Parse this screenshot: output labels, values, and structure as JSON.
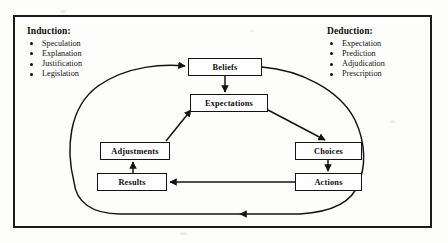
{
  "diagram": {
    "frame": {
      "border_color": "#1b1b1b"
    },
    "panels": [
      {
        "id": "induction",
        "title": "Induction:",
        "items": [
          "Speculation",
          "Explanation",
          "Justification",
          "Legislation"
        ]
      },
      {
        "id": "deduction",
        "title": "Deduction:",
        "items": [
          "Expectation",
          "Prediction",
          "Adjudication",
          "Prescription"
        ]
      }
    ],
    "nodes": [
      {
        "id": "beliefs",
        "label": "Beliefs"
      },
      {
        "id": "expectations",
        "label": "Expectations"
      },
      {
        "id": "adjustments",
        "label": "Adjustments"
      },
      {
        "id": "results",
        "label": "Results"
      },
      {
        "id": "choices",
        "label": "Choices"
      },
      {
        "id": "actions",
        "label": "Actions"
      }
    ],
    "edges": [
      {
        "from": "loop-left",
        "to": "beliefs",
        "style": "curved",
        "arrow": true
      },
      {
        "from": "beliefs",
        "to": "expectations",
        "style": "straight-down",
        "arrow": true
      },
      {
        "from": "beliefs",
        "to": "loop-right",
        "style": "curved",
        "arrow": false
      },
      {
        "from": "expectations",
        "to": "choices",
        "style": "diagonal",
        "arrow": true
      },
      {
        "from": "choices",
        "to": "actions",
        "style": "straight-down",
        "arrow": true
      },
      {
        "from": "actions",
        "to": "results",
        "style": "straight-left",
        "arrow": true
      },
      {
        "from": "results",
        "to": "adjustments",
        "style": "straight-up",
        "arrow": true
      },
      {
        "from": "adjustments",
        "to": "expectations",
        "style": "diagonal",
        "arrow": true
      },
      {
        "from": "actions",
        "to": "loop-bottom",
        "style": "curved",
        "arrow": true
      }
    ],
    "colors": {
      "line": "#141414",
      "box_fill": "#ffffff",
      "background": "#fdfdfb"
    }
  }
}
